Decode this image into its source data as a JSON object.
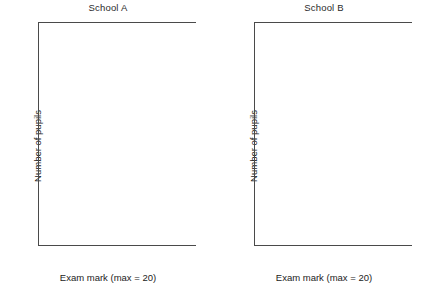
{
  "figure": {
    "panels": [
      "school_a",
      "school_b"
    ]
  },
  "axes": {
    "ylabel": "Number of pupils",
    "xlabel": "Exam mark (max = 20)",
    "ylim": [
      0,
      25
    ],
    "ytick_labels": [
      "0",
      "5",
      "10",
      "15",
      "20",
      "25"
    ],
    "yticks": [
      0,
      5,
      10,
      15,
      20,
      25
    ],
    "xlim": [
      0,
      20
    ],
    "xticks": [
      0,
      1,
      2,
      3,
      4,
      5,
      6,
      7,
      8,
      9,
      10,
      11,
      12,
      13,
      14,
      15,
      16,
      17,
      18,
      19,
      20
    ],
    "xtick_labels": [
      "0",
      "",
      "2",
      "",
      "4",
      "",
      "6",
      "",
      "8",
      "",
      "10",
      "",
      "12",
      "",
      "14",
      "",
      "16",
      "",
      "18",
      "",
      "20"
    ]
  },
  "style": {
    "bar_fill": "#c9c9c9",
    "bar_stroke": "#6d6d6d",
    "axis_color": "#4a4a4a",
    "background": "#ffffff"
  },
  "chart_data": [
    {
      "type": "bar",
      "id": "school_a",
      "title": "School A",
      "xlabel": "Exam mark (max = 20)",
      "ylabel": "Number of pupils",
      "ylim": [
        0,
        25
      ],
      "xlim": [
        0,
        20
      ],
      "grid": false,
      "legend": "none",
      "categories": [
        0,
        1,
        2,
        3,
        4,
        5,
        6,
        7,
        8,
        9,
        10,
        11,
        12,
        13,
        14,
        15,
        16,
        17,
        18,
        19,
        20
      ],
      "values": [
        8,
        4,
        5,
        11,
        14,
        12,
        12,
        20,
        16,
        15,
        21,
        20,
        19,
        19,
        15,
        6,
        7,
        5,
        7,
        5,
        8
      ]
    },
    {
      "type": "bar",
      "id": "school_b",
      "title": "School B",
      "xlabel": "Exam mark (max = 20)",
      "ylabel": "Number of pupils",
      "ylim": [
        0,
        25
      ],
      "xlim": [
        0,
        20
      ],
      "grid": false,
      "legend": "none",
      "categories": [
        0,
        1,
        2,
        3,
        4,
        5,
        6,
        7,
        8,
        9,
        10,
        11,
        12,
        13,
        14,
        15,
        16,
        17,
        18,
        19,
        20
      ],
      "values": [
        6,
        2,
        2,
        4,
        8,
        6,
        11,
        18,
        15,
        22,
        24,
        16,
        16,
        17,
        12,
        20,
        14,
        7,
        7,
        11,
        12
      ]
    }
  ]
}
